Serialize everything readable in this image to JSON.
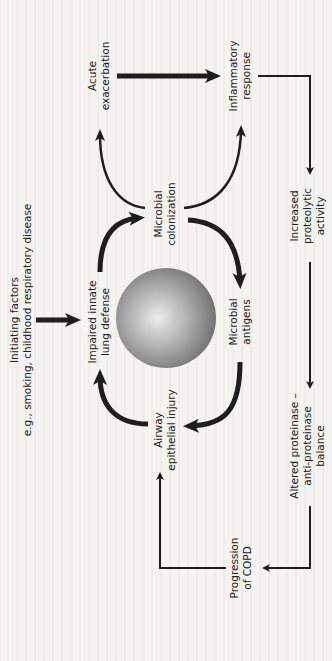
{
  "diagram": {
    "orientation": "rotated-90-ccw",
    "nodes": {
      "initiating": {
        "line1": "Initiating factors",
        "line2": "e.g., smoking, childhood respiratory disease"
      },
      "impaired": {
        "line1": "Impaired innate",
        "line2": "lung defense"
      },
      "colonization": {
        "line1": "Microbial",
        "line2": "colonization"
      },
      "antigens": {
        "line1": "Microbial",
        "line2": "antigens"
      },
      "airway": {
        "line1": "Airway",
        "line2": "epithelial injury"
      },
      "acute": {
        "line1": "Acute",
        "line2": "exacerbation"
      },
      "inflammatory": {
        "line1": "Inflammatory",
        "line2": "response"
      },
      "proteolytic": {
        "line1": "Increased",
        "line2": "proteolytic",
        "line3": "activity"
      },
      "balance": {
        "line1": "Altered proteinase –",
        "line2": "anti-proteinase",
        "line3": "balance"
      },
      "progression": {
        "line1": "Progression",
        "line2": "of COPD"
      }
    },
    "edges": [
      {
        "from": "Initiating factors",
        "to": "Impaired innate lung defense"
      },
      {
        "from": "Impaired innate lung defense",
        "to": "Microbial colonization"
      },
      {
        "from": "Microbial colonization",
        "to": "Microbial antigens"
      },
      {
        "from": "Microbial antigens",
        "to": "Airway epithelial injury"
      },
      {
        "from": "Airway epithelial injury",
        "to": "Impaired innate lung defense"
      },
      {
        "from": "Microbial colonization",
        "to": "Acute exacerbation"
      },
      {
        "from": "Microbial colonization",
        "to": "Inflammatory response"
      },
      {
        "from": "Acute exacerbation",
        "to": "Inflammatory response"
      },
      {
        "from": "Inflammatory response",
        "to": "Increased proteolytic activity"
      },
      {
        "from": "Increased proteolytic activity",
        "to": "Altered proteinase – anti-proteinase balance"
      },
      {
        "from": "Altered proteinase – anti-proteinase balance",
        "to": "Progression of COPD"
      },
      {
        "from": "Progression of COPD",
        "to": "Airway epithelial injury"
      }
    ],
    "colors": {
      "background": "#f4f3ef",
      "ink": "#1e1e1e",
      "sphere_light": "#e6e6e6",
      "sphere_dark": "#6e6e6e"
    }
  }
}
